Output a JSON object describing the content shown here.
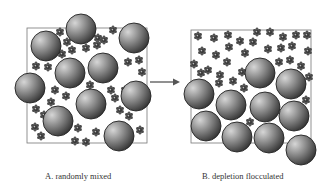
{
  "panels": [
    {
      "id": "A",
      "caption": "A. randomly mixed",
      "box": {
        "x": 27,
        "y": 28,
        "w": 120,
        "h": 115
      },
      "particles": [
        [
          81,
          29,
          15
        ],
        [
          46,
          46,
          15
        ],
        [
          134,
          38,
          15
        ],
        [
          70,
          73,
          15
        ],
        [
          103,
          68,
          15
        ],
        [
          30,
          88,
          15
        ],
        [
          136,
          96,
          15
        ],
        [
          91,
          104,
          15
        ],
        [
          58,
          121,
          15
        ],
        [
          119,
          136,
          15
        ]
      ],
      "coils": [
        [
          60,
          32
        ],
        [
          67,
          42
        ],
        [
          56,
          41
        ],
        [
          72,
          50
        ],
        [
          62,
          54
        ],
        [
          86,
          48
        ],
        [
          97,
          45
        ],
        [
          104,
          40
        ],
        [
          113,
          30
        ],
        [
          98,
          38
        ],
        [
          128,
          62
        ],
        [
          139,
          60
        ],
        [
          36,
          66
        ],
        [
          48,
          67
        ],
        [
          142,
          72
        ],
        [
          90,
          85
        ],
        [
          111,
          90
        ],
        [
          55,
          90
        ],
        [
          66,
          96
        ],
        [
          51,
          102
        ],
        [
          36,
          109
        ],
        [
          120,
          110
        ],
        [
          129,
          116
        ],
        [
          35,
          127
        ],
        [
          41,
          136
        ],
        [
          78,
          128
        ],
        [
          96,
          132
        ],
        [
          75,
          141
        ],
        [
          86,
          142
        ],
        [
          140,
          130
        ],
        [
          115,
          98
        ],
        [
          125,
          90
        ],
        [
          44,
          115
        ]
      ]
    },
    {
      "id": "B",
      "caption": "B. depletion flocculated",
      "box": {
        "x": 191,
        "y": 30,
        "w": 120,
        "h": 113
      },
      "particles": [
        [
          199,
          94,
          15
        ],
        [
          231,
          105,
          15
        ],
        [
          260,
          73,
          15
        ],
        [
          291,
          84,
          15
        ],
        [
          206,
          126,
          15
        ],
        [
          265,
          107,
          15
        ],
        [
          294,
          116,
          15
        ],
        [
          237,
          137,
          15
        ],
        [
          269,
          138,
          15
        ],
        [
          301,
          150,
          15
        ]
      ],
      "coils": [
        [
          198,
          36
        ],
        [
          214,
          38
        ],
        [
          228,
          35
        ],
        [
          240,
          41
        ],
        [
          253,
          42
        ],
        [
          257,
          32
        ],
        [
          270,
          32
        ],
        [
          283,
          37
        ],
        [
          296,
          35
        ],
        [
          307,
          35
        ],
        [
          202,
          51
        ],
        [
          216,
          55
        ],
        [
          229,
          47
        ],
        [
          245,
          53
        ],
        [
          268,
          49
        ],
        [
          281,
          48
        ],
        [
          292,
          46
        ],
        [
          308,
          51
        ],
        [
          194,
          64
        ],
        [
          208,
          70
        ],
        [
          227,
          62
        ],
        [
          242,
          72
        ],
        [
          279,
          62
        ],
        [
          290,
          60
        ],
        [
          301,
          66
        ],
        [
          201,
          73
        ],
        [
          219,
          83
        ],
        [
          233,
          81
        ],
        [
          244,
          88
        ],
        [
          220,
          75
        ],
        [
          309,
          77
        ],
        [
          306,
          100
        ],
        [
          250,
          122
        ]
      ]
    }
  ],
  "arrow": {
    "x1": 150,
    "y1": 82,
    "x2": 180,
    "y2": 82,
    "label": ""
  },
  "colors": {
    "particle_light": "#c8c8c8",
    "particle_dark": "#3a3a3a",
    "particle_stroke": "#222222",
    "coil": "#5a5a5a",
    "box_stroke": "#777777",
    "arrow": "#555555"
  }
}
